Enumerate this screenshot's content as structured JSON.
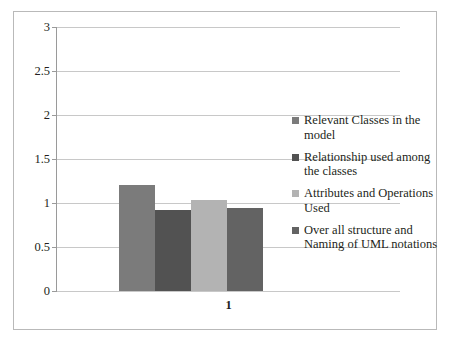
{
  "chart_data": {
    "type": "bar",
    "title": "",
    "xlabel": "",
    "ylabel": "",
    "categories": [
      "1"
    ],
    "ylim": [
      0,
      3
    ],
    "ytick_labels": [
      "3",
      "2.5",
      "2",
      "1.5",
      "1",
      "0.5",
      "0"
    ],
    "ytick_values": [
      3,
      2.5,
      2,
      1.5,
      1,
      0.5,
      0
    ],
    "grid": true,
    "legend_position": "right",
    "series": [
      {
        "name": "Relevant Classes in the model",
        "values": [
          1.2
        ],
        "color": "#7b7b7b"
      },
      {
        "name": "Relationship used among the classes",
        "values": [
          0.92
        ],
        "color": "#525252"
      },
      {
        "name": "Attributes and Operations Used",
        "values": [
          1.03
        ],
        "color": "#b3b3b3"
      },
      {
        "name": "Over all structure and Naming of UML notations",
        "values": [
          0.94
        ],
        "color": "#636363"
      }
    ]
  },
  "axis": {
    "category_label": "1"
  },
  "style": {
    "frame_border": "#b9b9b9",
    "gridline": "#c8c8c8",
    "axis": "#9a9a9a",
    "text": "#231f20"
  }
}
